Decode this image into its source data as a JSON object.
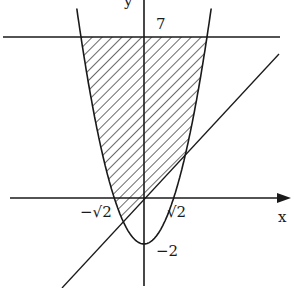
{
  "diagram": {
    "type": "function-plot",
    "curves": [
      {
        "name": "parabola",
        "equation": "y = x^2 - 2"
      },
      {
        "name": "line",
        "equation": "y = x"
      },
      {
        "name": "horizontal-line",
        "equation": "y = 7"
      }
    ],
    "shaded_region": "region between parabola, line y=x and y=7",
    "axes": {
      "x_label": "x",
      "y_label": "y"
    },
    "labels": {
      "y_top": "7",
      "x_neg": "−√2",
      "x_pos": "√2",
      "y_vertex": "−2"
    },
    "colors": {
      "ink": "#1a1a1a",
      "background": "#ffffff"
    }
  }
}
